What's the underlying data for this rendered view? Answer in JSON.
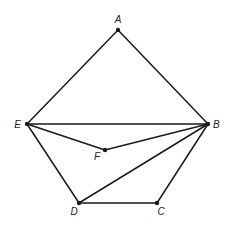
{
  "diagram": {
    "type": "geometry",
    "stroke_color": "#1a1a1a",
    "label_color": "#222222",
    "points": [
      {
        "id": "A",
        "label": "A",
        "x": 118,
        "y": 30,
        "lx": 118,
        "ly": 23,
        "anchor": "middle"
      },
      {
        "id": "B",
        "label": "B",
        "x": 208,
        "y": 124,
        "lx": 213,
        "ly": 128,
        "anchor": "start"
      },
      {
        "id": "C",
        "label": "C",
        "x": 157,
        "y": 203,
        "lx": 161,
        "ly": 215,
        "anchor": "middle"
      },
      {
        "id": "D",
        "label": "D",
        "x": 79,
        "y": 203,
        "lx": 74,
        "ly": 215,
        "anchor": "middle"
      },
      {
        "id": "E",
        "label": "E",
        "x": 27,
        "y": 124,
        "lx": 21,
        "ly": 128,
        "anchor": "end"
      },
      {
        "id": "F",
        "label": "F",
        "x": 105,
        "y": 150,
        "lx": 97,
        "ly": 160,
        "anchor": "middle"
      }
    ],
    "segments": [
      [
        "A",
        "E"
      ],
      [
        "A",
        "B"
      ],
      [
        "E",
        "B"
      ],
      [
        "E",
        "F"
      ],
      [
        "F",
        "B"
      ],
      [
        "E",
        "D"
      ],
      [
        "D",
        "C"
      ],
      [
        "C",
        "B"
      ],
      [
        "D",
        "B"
      ]
    ]
  }
}
